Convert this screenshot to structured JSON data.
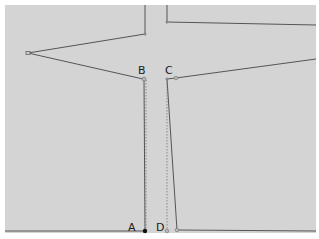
{
  "diagram": {
    "background_color": "#d4d4d4",
    "line_color": "#555555",
    "guide_color": "#888888",
    "points": [
      {
        "id": "A",
        "label": "A"
      },
      {
        "id": "B",
        "label": "B"
      },
      {
        "id": "C",
        "label": "C"
      },
      {
        "id": "D",
        "label": "D"
      }
    ]
  }
}
